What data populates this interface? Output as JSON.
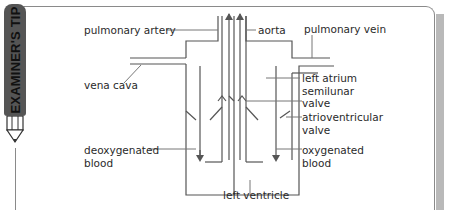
{
  "badge": {
    "text": "EXAMINER'S TIP"
  },
  "diagram": {
    "labels": {
      "pulmonary_artery": "pulmonary artery",
      "aorta": "aorta",
      "pulmonary_vein": "pulmonary vein",
      "vena_cava": "vena cava",
      "left_atrium": "left atrium",
      "semilunar_valve_1": "semilunar",
      "semilunar_valve_2": "valve",
      "atrioventricular_valve_1": "atrioventricular",
      "atrioventricular_valve_2": "valve",
      "deoxygenated_blood_1": "deoxygenated",
      "deoxygenated_blood_2": "blood",
      "oxygenated_blood_1": "oxygenated",
      "oxygenated_blood_2": "blood",
      "left_ventricle": "left ventricle"
    },
    "colors": {
      "line": "#555555",
      "text": "#2a2a2a",
      "badge": "#555555",
      "shadow": "#b9b9b9"
    }
  }
}
